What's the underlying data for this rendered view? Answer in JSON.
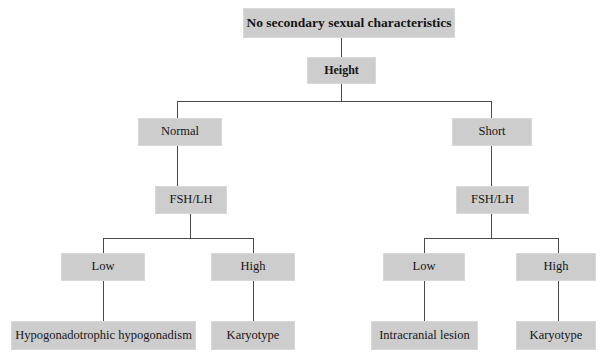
{
  "diagram": {
    "title": "No secondary sexual characteristics",
    "type": "flowchart",
    "colors": {
      "node_fill": "#cdcdcd",
      "node_border": "#d8d8d8",
      "edge": "#4a4a4a",
      "background": "#ffffff",
      "text": "#151515"
    },
    "nodes": {
      "root": "No secondary sexual characteristics",
      "height": "Height",
      "left_branch": "Normal",
      "right_branch": "Short",
      "left_fshlh": "FSH/LH",
      "right_fshlh": "FSH/LH",
      "left_low": "Low",
      "left_high": "High",
      "right_low": "Low",
      "right_high": "High",
      "left_low_leaf": "Hypogonadotrophic hypogonadism",
      "left_high_leaf": "Karyotype",
      "right_low_leaf": "Intracranial lesion",
      "right_high_leaf": "Karyotype"
    }
  }
}
